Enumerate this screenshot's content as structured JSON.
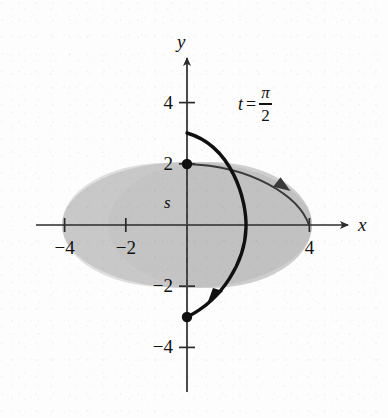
{
  "chart_data": {
    "type": "scatter",
    "title": "",
    "xlabel": "x",
    "ylabel": "y",
    "xlim": [
      -5.4,
      5.4
    ],
    "ylim": [
      -5.0,
      5.2
    ],
    "grid": false,
    "legend": null,
    "annotations": [
      {
        "name": "parameter-label",
        "text": "t = π/2",
        "t_symbol": "t",
        "equals": "=",
        "numerator": "π",
        "denominator": "2",
        "x": 1.6,
        "y": 3.95
      },
      {
        "name": "segment-label",
        "text": "s",
        "x": -0.62,
        "y": 0.72
      }
    ],
    "x_ticks": [
      {
        "value": -4,
        "label": "−4"
      },
      {
        "value": -2,
        "label": "−2"
      },
      {
        "value": 4,
        "label": "4"
      }
    ],
    "y_ticks": [
      {
        "value": 4,
        "label": "4"
      },
      {
        "value": 2,
        "label": "2"
      },
      {
        "value": -2,
        "label": "−2"
      },
      {
        "value": -4,
        "label": "−4"
      }
    ],
    "series": [
      {
        "name": "shaded-region",
        "type": "area",
        "shape": "ellipse",
        "center": [
          0,
          0
        ],
        "semi_axis_x": 4.1,
        "semi_axis_y": 2.05,
        "fill": "#c9c9c9",
        "stroke": "none"
      },
      {
        "name": "thin-ellipse-path",
        "type": "line",
        "shape": "ellipse-arc",
        "from": [
          0,
          2
        ],
        "to": [
          4,
          0
        ],
        "direction": "clockwise",
        "arrow_at": [
          3.1,
          1.2
        ],
        "stroke": "#3a3a3a",
        "width": 1.6
      },
      {
        "name": "bold-curve",
        "type": "line",
        "shape": "arc",
        "from": [
          0,
          3
        ],
        "through": [
          1.95,
          0
        ],
        "to": [
          0,
          -3
        ],
        "direction": "clockwise",
        "arrow_at": [
          0.78,
          -2.55
        ],
        "stroke": "#101010",
        "width": 3.4
      }
    ],
    "points": [
      {
        "name": "point-top",
        "x": 0,
        "y": 2,
        "marker": "filled-circle",
        "color": "#101010",
        "size": 9
      },
      {
        "name": "point-bottom",
        "x": 0,
        "y": -3,
        "marker": "filled-circle",
        "color": "#101010",
        "size": 9
      }
    ],
    "dashed_segment": {
      "name": "s-segment",
      "from": [
        0,
        2
      ],
      "to": [
        0,
        -3
      ],
      "style": "dashed",
      "color": "#4a4a4a"
    },
    "colors": {
      "background": "#fdfdfd",
      "region_fill": "#c9c9c9",
      "region_fill_overlap": "#bdbdbd",
      "axis": "#2b2b2b",
      "bold_curve": "#101010",
      "thin_curve": "#3a3a3a",
      "text": "#121212"
    }
  }
}
